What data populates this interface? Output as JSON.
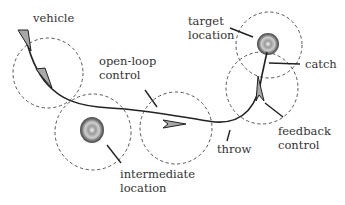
{
  "diagram": {
    "labels": {
      "vehicle": "vehicle",
      "open_loop_1": "open-loop",
      "open_loop_2": "control",
      "target_1": "target",
      "target_2": "location",
      "catch": "catch",
      "feedback_1": "feedback",
      "feedback_2": "control",
      "throw": "throw",
      "intermediate_1": "intermediate",
      "intermediate_2": "location"
    },
    "colors": {
      "stroke": "#222222",
      "dashed_circle": "#555555",
      "arrow_fill": "#a8a8a8",
      "text": "#333333"
    }
  }
}
